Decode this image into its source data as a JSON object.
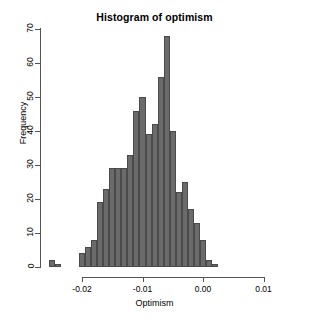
{
  "chart_data": {
    "type": "bar",
    "title": "Histogram of optimism",
    "xlabel": "Optimism",
    "ylabel": "Frequency",
    "grid": false,
    "legend": "none",
    "bar_color": "#6b6b6b",
    "bar_border_color": "#4a4a4a",
    "axis_color": "#555555",
    "background": "#ffffff",
    "xlim": [
      -0.0255,
      0.0145
    ],
    "ylim": [
      0,
      70
    ],
    "bin_width": 0.001,
    "x_ticks": [
      -0.02,
      -0.01,
      0.0,
      0.01
    ],
    "x_tick_labels": [
      "-0.02",
      "-0.01",
      "0.00",
      "0.01"
    ],
    "y_ticks": [
      0,
      10,
      20,
      30,
      40,
      50,
      60,
      70
    ],
    "y_tick_labels": [
      "0",
      "10",
      "20",
      "30",
      "40",
      "50",
      "60",
      "70"
    ],
    "bin_starts": [
      -0.0255,
      -0.0245,
      -0.0235,
      -0.0225,
      -0.0215,
      -0.0205,
      -0.0195,
      -0.0185,
      -0.0175,
      -0.0165,
      -0.0155,
      -0.0145,
      -0.0135,
      -0.0125,
      -0.0115,
      -0.0105,
      -0.0095,
      -0.0085,
      -0.0075,
      -0.0065,
      -0.0055,
      -0.0045,
      -0.0035,
      -0.0025,
      -0.0015,
      -0.0005,
      0.0005,
      0.0015,
      0.0025,
      0.0035,
      0.0045,
      0.0055,
      0.0065,
      0.0075,
      0.0085,
      0.0095,
      0.0105,
      0.0115,
      0.0125,
      0.0135
    ],
    "categories": [
      "-0.0250",
      "-0.0240",
      "-0.0230",
      "-0.0220",
      "-0.0210",
      "-0.0200",
      "-0.0190",
      "-0.0180",
      "-0.0170",
      "-0.0160",
      "-0.0150",
      "-0.0140",
      "-0.0130",
      "-0.0120",
      "-0.0110",
      "-0.0100",
      "-0.0090",
      "-0.0080",
      "-0.0070",
      "-0.0060",
      "-0.0050",
      "-0.0040",
      "-0.0030",
      "-0.0020",
      "-0.0010",
      "0.0000",
      "0.0010",
      "0.0020",
      "0.0030",
      "0.0040",
      "0.0050",
      "0.0060",
      "0.0070",
      "0.0080",
      "0.0090",
      "0.0100",
      "0.0110",
      "0.0120",
      "0.0130",
      "0.0140"
    ],
    "values": [
      2,
      1,
      0,
      0,
      0,
      4,
      6,
      8,
      19,
      23,
      29,
      29,
      29,
      33,
      46,
      50,
      39,
      42,
      56,
      68,
      40,
      22,
      25,
      17,
      13,
      8,
      2,
      1,
      0,
      0,
      0,
      0,
      0,
      0,
      0,
      0,
      0,
      0,
      0,
      0
    ]
  }
}
